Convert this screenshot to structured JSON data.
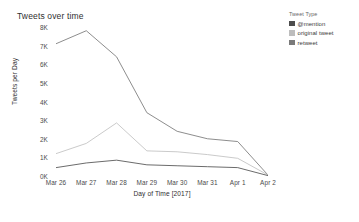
{
  "chart_data": {
    "type": "line",
    "title": "Tweets over time",
    "xlabel": "Day of Time [2017]",
    "ylabel": "Tweets per Day",
    "categories": [
      "Mar 26",
      "Mar 27",
      "Mar 28",
      "Mar 29",
      "Mar 30",
      "Mar 31",
      "Apr 1",
      "Apr 2"
    ],
    "ylim": [
      0,
      8000
    ],
    "ytick_values": [
      0,
      1000,
      2000,
      3000,
      4000,
      5000,
      6000,
      7000,
      8000
    ],
    "ytick_labels": [
      "0K",
      "1K",
      "2K",
      "3K",
      "4K",
      "5K",
      "6K",
      "7K",
      "8K"
    ],
    "grid": false,
    "legend_position": "right",
    "legend_title": "Tweet Type",
    "series": [
      {
        "name": "@mention",
        "color": "#4d4d4d",
        "values": [
          450,
          700,
          850,
          600,
          550,
          500,
          450,
          20
        ]
      },
      {
        "name": "original tweet",
        "color": "#bdbdbd",
        "values": [
          7100,
          7800,
          6400,
          3400,
          2400,
          2000,
          1850,
          50
        ]
      },
      {
        "name": "retweet",
        "color": "#7a7a7a",
        "values": [
          1200,
          1750,
          2850,
          1350,
          1300,
          1150,
          950,
          50
        ]
      }
    ],
    "line_render_order": [
      "original tweet",
      "retweet",
      "@mention"
    ],
    "line_colors_drawn": {
      "original tweet": "#808080",
      "retweet": "#c4c4c4",
      "@mention": "#5a5a5a"
    }
  },
  "legend": {
    "title": "Tweet Type",
    "items": [
      {
        "label": "@mention",
        "color": "#4d4d4d"
      },
      {
        "label": "original tweet",
        "color": "#bdbdbd"
      },
      {
        "label": "retweet",
        "color": "#7a7a7a"
      }
    ]
  }
}
